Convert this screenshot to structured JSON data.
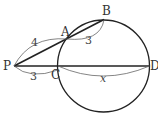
{
  "diagram": {
    "points": {
      "P": {
        "label": "P"
      },
      "A": {
        "label": "A"
      },
      "B": {
        "label": "B"
      },
      "C": {
        "label": "C"
      },
      "D": {
        "label": "D"
      }
    },
    "measures": {
      "PA": "4",
      "AB": "3",
      "PC": "3",
      "CD": "x"
    },
    "colors": {
      "line": "#222222",
      "arc": "#555555",
      "text": "#333333"
    }
  }
}
